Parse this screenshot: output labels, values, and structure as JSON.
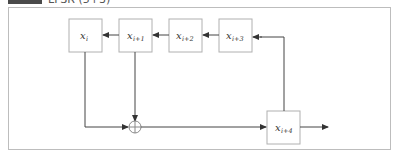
{
  "header": {
    "badge": "",
    "text": "LFSR (5+3)"
  },
  "diagram": {
    "type": "shift-register-feedback",
    "registers": [
      {
        "id": "xi",
        "base": "x",
        "subscript": "i"
      },
      {
        "id": "xi1",
        "base": "x",
        "subscript": "i+1"
      },
      {
        "id": "xi2",
        "base": "x",
        "subscript": "i+2"
      },
      {
        "id": "xi3",
        "base": "x",
        "subscript": "i+3"
      },
      {
        "id": "xi4",
        "base": "x",
        "subscript": "i+4"
      }
    ],
    "operator": "xor",
    "colors": {
      "box_border": "#b0b0b0",
      "line": "#444444",
      "frame": "#bdbdbd"
    }
  }
}
